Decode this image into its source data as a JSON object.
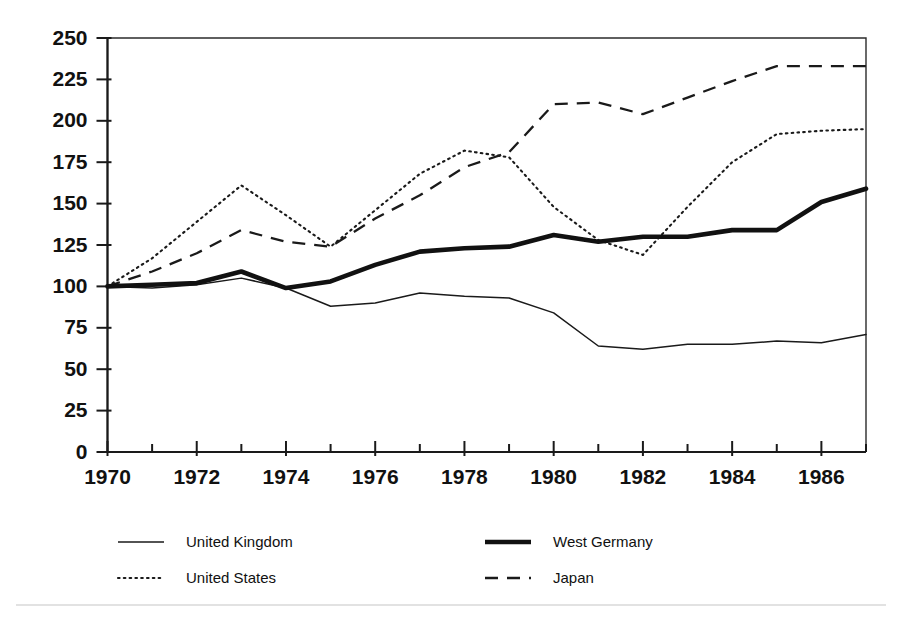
{
  "chart_data": {
    "type": "line",
    "title": "",
    "subtitle": "",
    "xlabel": "",
    "ylabel": "",
    "xlim": [
      1970,
      1987
    ],
    "ylim": [
      0,
      250
    ],
    "grid": false,
    "legend_position": "bottom",
    "x": [
      1970,
      1971,
      1972,
      1973,
      1974,
      1975,
      1976,
      1977,
      1978,
      1979,
      1980,
      1981,
      1982,
      1983,
      1984,
      1985,
      1986,
      1987
    ],
    "xtick_labels": [
      "1970",
      "1972",
      "1974",
      "1976",
      "1978",
      "1980",
      "1982",
      "1984",
      "1986"
    ],
    "xtick_values": [
      1970,
      1972,
      1974,
      1976,
      1978,
      1980,
      1982,
      1984,
      1986
    ],
    "ytick_labels": [
      "0",
      "25",
      "50",
      "75",
      "100",
      "125",
      "150",
      "175",
      "200",
      "225",
      "250"
    ],
    "ytick_values": [
      0,
      25,
      50,
      75,
      100,
      125,
      150,
      175,
      200,
      225,
      250
    ],
    "series": [
      {
        "name": "United Kingdom",
        "style": "thin-solid",
        "color": "#1a1a1a",
        "values": [
          100,
          99,
          101,
          105,
          99,
          88,
          90,
          96,
          94,
          93,
          84,
          64,
          62,
          65,
          65,
          67,
          66,
          71
        ]
      },
      {
        "name": "United States",
        "style": "dotted",
        "color": "#1a1a1a",
        "values": [
          100,
          117,
          139,
          161,
          143,
          124,
          146,
          168,
          182,
          178,
          148,
          128,
          119,
          148,
          175,
          192,
          194,
          195
        ]
      },
      {
        "name": "West Germany",
        "style": "thick-solid",
        "color": "#111111",
        "values": [
          100,
          101,
          102,
          109,
          99,
          103,
          113,
          121,
          123,
          124,
          131,
          127,
          130,
          130,
          134,
          134,
          151,
          159
        ]
      },
      {
        "name": "Japan",
        "style": "dashed",
        "color": "#1a1a1a",
        "values": [
          100,
          109,
          120,
          134,
          127,
          124,
          141,
          155,
          172,
          181,
          210,
          211,
          204,
          214,
          224,
          233,
          233,
          233
        ]
      }
    ]
  },
  "legend": {
    "entries": [
      {
        "label": "United Kingdom",
        "series_index": 0
      },
      {
        "label": "United States",
        "series_index": 1
      },
      {
        "label": "West Germany",
        "series_index": 2
      },
      {
        "label": "Japan",
        "series_index": 3
      }
    ]
  }
}
